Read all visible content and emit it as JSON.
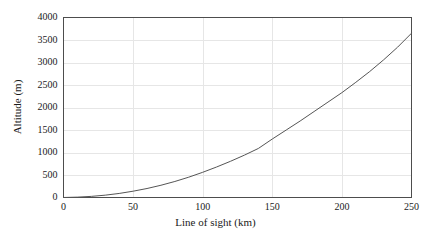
{
  "chart_data": {
    "type": "line",
    "title": "",
    "xlabel": "Line of sight (km)",
    "ylabel": "Altitude (m)",
    "xlim": [
      0,
      250
    ],
    "ylim": [
      0,
      4000
    ],
    "xticks": [
      0,
      50,
      100,
      150,
      200,
      250
    ],
    "yticks": [
      0,
      500,
      1000,
      1500,
      2000,
      2500,
      3000,
      3500,
      4000
    ],
    "xtick_labels": [
      "0",
      "50",
      "100",
      "150",
      "200",
      "250"
    ],
    "ytick_labels": [
      "0",
      "500",
      "1000",
      "1500",
      "2000",
      "2500",
      "3000",
      "3500",
      "4000"
    ],
    "grid": true,
    "legend": null,
    "series": [
      {
        "name": "altitude",
        "color": "#555555",
        "x": [
          0,
          10,
          20,
          30,
          40,
          50,
          60,
          70,
          80,
          90,
          100,
          110,
          120,
          130,
          140,
          150,
          160,
          170,
          180,
          190,
          200,
          210,
          220,
          230,
          240,
          250
        ],
        "values": [
          0,
          8,
          25,
          52,
          90,
          140,
          200,
          272,
          356,
          452,
          560,
          678,
          805,
          942,
          1090,
          1300,
          1500,
          1700,
          1910,
          2120,
          2330,
          2560,
          2800,
          3060,
          3340,
          3650
        ]
      }
    ]
  },
  "axes": {
    "frame_color": "#4d4d4d",
    "grid_color": "#e6e6e6",
    "background": "#ffffff"
  }
}
